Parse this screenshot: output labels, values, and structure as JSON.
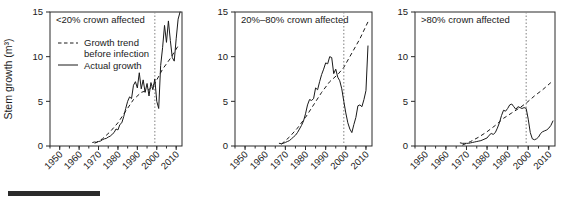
{
  "figure": {
    "scale_bar": "scale-bar",
    "y_axis_label": "Stem growth (m³)",
    "x_axis_label": "Year"
  },
  "chart_data": {
    "type": "line",
    "title": "",
    "xlabel": "Year",
    "ylabel": "Stem growth (m³)",
    "xlim": [
      1945,
      2013
    ],
    "ylim": [
      0,
      15
    ],
    "yticks": [
      0,
      5,
      10,
      15
    ],
    "ytick_labels": [
      "0",
      "5",
      "10",
      "15"
    ],
    "xticks": [
      1950,
      1960,
      1970,
      1980,
      1990,
      2000,
      2010
    ],
    "xtick_labels": [
      "1950",
      "1960",
      "1970",
      "1980",
      "1990",
      "2000",
      "2010"
    ],
    "xminor_step": 5,
    "grid": false,
    "legend_position": "top-left-panel-1",
    "legend": [
      {
        "label": "Growth trend before infection",
        "style": "dashed"
      },
      {
        "label": "Actual growth",
        "style": "solid"
      }
    ],
    "annotations": [
      {
        "type": "vline",
        "x": 1999,
        "style": "dotted",
        "color": "#8c8c8c",
        "label": "infection year"
      }
    ],
    "panels": [
      {
        "name": "panel-less-than-20",
        "title": "<20% crown affected",
        "series": [
          {
            "name": "Actual growth",
            "style": "solid",
            "x": [
              1967,
              1968,
              1969,
              1970,
              1971,
              1972,
              1973,
              1974,
              1975,
              1976,
              1977,
              1978,
              1979,
              1980,
              1981,
              1982,
              1983,
              1984,
              1985,
              1986,
              1987,
              1988,
              1989,
              1990,
              1991,
              1992,
              1993,
              1994,
              1995,
              1996,
              1997,
              1998,
              1999,
              2000,
              2001,
              2002,
              2003,
              2004,
              2005,
              2006,
              2007,
              2008,
              2009,
              2010,
              2011,
              2012
            ],
            "values": [
              0.4,
              0.45,
              0.4,
              0.5,
              0.55,
              0.7,
              0.8,
              0.85,
              1.0,
              1.1,
              1.3,
              1.5,
              1.9,
              1.8,
              2.4,
              2.6,
              3.3,
              4.2,
              5.0,
              5.5,
              5.3,
              6.8,
              7.2,
              6.5,
              8.2,
              6.4,
              7.4,
              6.0,
              7.0,
              5.6,
              7.1,
              6.3,
              7.5,
              5.0,
              4.2,
              9.0,
              11.0,
              13.5,
              11.6,
              14.0,
              11.8,
              9.9,
              9.5,
              12.0,
              14.2,
              15.0
            ]
          },
          {
            "name": "Growth trend before infection",
            "style": "dashed",
            "x": [
              1968,
              1972,
              1976,
              1980,
              1984,
              1988,
              1992,
              1996,
              1999,
              2003,
              2007,
              2011
            ],
            "values": [
              0.3,
              0.8,
              1.6,
              2.6,
              3.9,
              5.2,
              6.0,
              6.3,
              7.0,
              8.6,
              9.8,
              11.2
            ]
          }
        ]
      },
      {
        "name": "panel-20-to-80",
        "title": "20%–80% crown affected",
        "series": [
          {
            "name": "Actual growth",
            "style": "solid",
            "x": [
              1967,
              1968,
              1969,
              1970,
              1971,
              1972,
              1973,
              1974,
              1975,
              1976,
              1977,
              1978,
              1979,
              1980,
              1981,
              1982,
              1983,
              1984,
              1985,
              1986,
              1987,
              1988,
              1989,
              1990,
              1991,
              1992,
              1993,
              1994,
              1995,
              1996,
              1997,
              1998,
              1999,
              2000,
              2001,
              2002,
              2003,
              2004,
              2005,
              2006,
              2007,
              2008,
              2009,
              2010,
              2011
            ],
            "values": [
              0.3,
              0.25,
              0.3,
              0.4,
              0.5,
              0.6,
              0.8,
              1.0,
              1.2,
              1.5,
              1.9,
              2.3,
              2.8,
              3.6,
              4.6,
              5.2,
              5.1,
              5.3,
              6.5,
              6.3,
              7.2,
              8.0,
              8.6,
              9.3,
              9.2,
              10.0,
              9.9,
              8.1,
              8.6,
              7.7,
              7.3,
              6.4,
              5.0,
              3.7,
              2.6,
              1.9,
              1.5,
              2.4,
              3.2,
              4.5,
              4.6,
              4.4,
              5.2,
              6.2,
              11.2
            ]
          },
          {
            "name": "Growth trend before infection",
            "style": "dashed",
            "x": [
              1968,
              1972,
              1976,
              1980,
              1984,
              1988,
              1992,
              1996,
              1999,
              2003,
              2007,
              2011
            ],
            "values": [
              0.2,
              1.0,
              2.0,
              3.2,
              4.6,
              6.0,
              7.2,
              8.0,
              8.8,
              10.4,
              12.0,
              13.9
            ]
          }
        ]
      },
      {
        "name": "panel-greater-than-80",
        "title": ">80% crown affected",
        "series": [
          {
            "name": "Actual growth",
            "style": "solid",
            "x": [
              1967,
              1968,
              1969,
              1970,
              1971,
              1972,
              1973,
              1974,
              1975,
              1976,
              1977,
              1978,
              1979,
              1980,
              1981,
              1982,
              1983,
              1984,
              1985,
              1986,
              1987,
              1988,
              1989,
              1990,
              1991,
              1992,
              1993,
              1994,
              1995,
              1996,
              1997,
              1998,
              1999,
              2000,
              2001,
              2002,
              2003,
              2004,
              2005,
              2006,
              2007,
              2008,
              2009,
              2010,
              2011,
              2012
            ],
            "values": [
              0.35,
              0.3,
              0.3,
              0.3,
              0.3,
              0.35,
              0.4,
              0.45,
              0.5,
              0.55,
              0.6,
              0.7,
              0.8,
              0.9,
              1.2,
              1.4,
              1.3,
              1.5,
              2.0,
              2.6,
              3.4,
              4.0,
              3.9,
              4.2,
              4.6,
              4.7,
              4.4,
              4.1,
              4.4,
              4.3,
              4.2,
              4.3,
              4.2,
              3.0,
              1.5,
              0.8,
              0.7,
              0.8,
              1.0,
              1.4,
              1.6,
              1.7,
              1.8,
              2.0,
              2.3,
              2.8
            ]
          },
          {
            "name": "Growth trend before infection",
            "style": "dashed",
            "x": [
              1968,
              1972,
              1976,
              1980,
              1984,
              1988,
              1992,
              1996,
              1999,
              2003,
              2007,
              2011
            ],
            "values": [
              0.1,
              0.5,
              1.0,
              1.6,
              2.3,
              3.1,
              3.7,
              4.3,
              4.8,
              5.6,
              6.3,
              7.1
            ]
          }
        ]
      }
    ]
  }
}
